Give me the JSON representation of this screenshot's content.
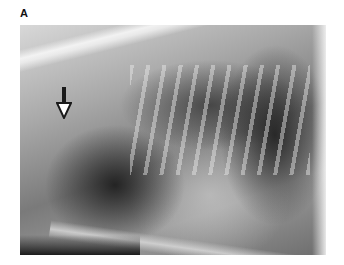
{
  "figure": {
    "panel_label": "A",
    "image": {
      "type": "lateral thoracic radiograph",
      "description": "Grayscale lateral chest X-ray of an animal thorax showing spine, ribs, lungs and heart silhouette",
      "annotation": {
        "icon": "down-arrow-icon",
        "description": "Open-headed arrow pointing down, indicating a structure near the trachea"
      }
    }
  }
}
